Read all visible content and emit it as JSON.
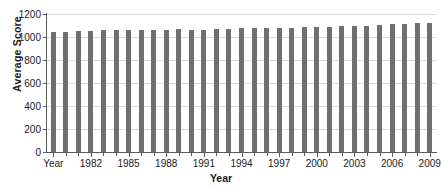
{
  "chart_data": {
    "type": "bar",
    "title": "",
    "xlabel": "Year",
    "ylabel": "Average Score",
    "ylim": [
      0,
      1200
    ],
    "ytick_values": [
      0,
      200,
      400,
      600,
      800,
      1000,
      1200
    ],
    "ytick_labels": [
      "0",
      "200",
      "400",
      "600",
      "800",
      "1000",
      "1200"
    ],
    "grid": true,
    "legend": "none",
    "bar_color": "#6f6f6f",
    "axis_color": "#5b5b5b",
    "gridline_color": "#d9d9d9",
    "categories": [
      "Year",
      "1980",
      "1981",
      "1982",
      "1983",
      "1984",
      "1985",
      "1986",
      "1987",
      "1988",
      "1989",
      "1990",
      "1991",
      "1992",
      "1993",
      "1994",
      "1995",
      "1996",
      "1997",
      "1998",
      "1999",
      "2000",
      "2001",
      "2002",
      "2003",
      "2004",
      "2005",
      "2006",
      "2007",
      "2008",
      "2009"
    ],
    "visible_xtick_labels": [
      "Year",
      "1982",
      "1985",
      "1988",
      "1991",
      "1994",
      "1997",
      "2000",
      "2003",
      "2006",
      "2009"
    ],
    "visible_xtick_indices": [
      0,
      3,
      6,
      9,
      12,
      15,
      18,
      21,
      24,
      27,
      30
    ],
    "values": [
      1045,
      1045,
      1050,
      1055,
      1060,
      1060,
      1060,
      1060,
      1065,
      1065,
      1070,
      1065,
      1065,
      1070,
      1070,
      1075,
      1075,
      1080,
      1080,
      1080,
      1085,
      1090,
      1090,
      1095,
      1095,
      1100,
      1105,
      1110,
      1115,
      1120,
      1125
    ]
  }
}
